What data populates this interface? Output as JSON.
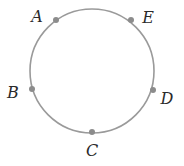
{
  "diagram": {
    "type": "circle-with-labeled-points",
    "circle": {
      "cx": 92,
      "cy": 71,
      "r": 62,
      "stroke": "#9a9a9a"
    },
    "dot_color": "#8c8c8c",
    "dot_radius": 3,
    "label_color": "#2a2a2a",
    "points": [
      {
        "id": "A",
        "label": "A",
        "x": 56,
        "y": 20,
        "label_x": 37,
        "label_y": 17
      },
      {
        "id": "E",
        "label": "E",
        "x": 131,
        "y": 20,
        "label_x": 148,
        "label_y": 18
      },
      {
        "id": "B",
        "label": "B",
        "x": 32,
        "y": 89,
        "label_x": 13,
        "label_y": 93
      },
      {
        "id": "D",
        "label": "D",
        "x": 153,
        "y": 90,
        "label_x": 167,
        "label_y": 99
      },
      {
        "id": "C",
        "label": "C",
        "x": 92,
        "y": 132,
        "label_x": 92,
        "label_y": 151
      }
    ]
  }
}
